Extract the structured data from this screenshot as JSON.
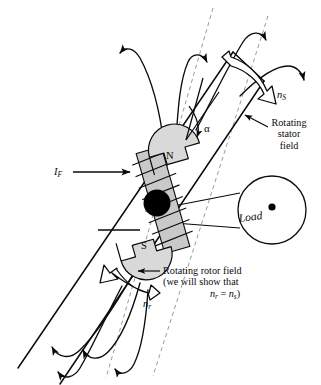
{
  "figure": {
    "type": "technical-diagram",
    "background_color": "#ffffff",
    "line_color": "#0a0a0a",
    "dashed_axis_color": "#9a9a9a",
    "pole_fill_color": "#d9d9d9",
    "shaft_fill_color": "#c9c9c9",
    "rotor_core_color": "#000000"
  },
  "labels": {
    "stator_speed": "n",
    "stator_speed_sub": "S",
    "rotor_speed": "n",
    "rotor_speed_sub": "r",
    "field_current": "I",
    "field_current_sub": "F",
    "alpha": "α",
    "north_pole": "N",
    "south_pole": "S",
    "load": "Load",
    "rotating_stator_field_line1": "Rotating",
    "rotating_stator_field_line2": "stator",
    "rotating_stator_field_line3": "field",
    "rotating_rotor_field_line1": "Rotating rotor field",
    "rotating_rotor_field_line2": "(we will show that",
    "rotating_rotor_field_line3_a": "n",
    "rotating_rotor_field_line3_a_sub": "r",
    "rotating_rotor_field_line3_eq": " = ",
    "rotating_rotor_field_line3_b": "n",
    "rotating_rotor_field_line3_b_sub": "s",
    "rotating_rotor_field_line3_close": ")"
  },
  "icons": {
    "stator_rotation_arrow": "block-curved-arrow-clockwise-icon",
    "rotor_rotation_arrow": "block-curved-arrow-counterclockwise-icon",
    "field_current_arrow": "arrow-right-icon",
    "leader_arrow_stator": "leader-arrow-icon",
    "leader_arrow_rotor": "leader-arrow-icon",
    "alpha_arc_arrow": "arc-arrow-icon",
    "flux_line_arrow": "flux-arrow-icon",
    "load_center_dot": "dot-icon"
  }
}
